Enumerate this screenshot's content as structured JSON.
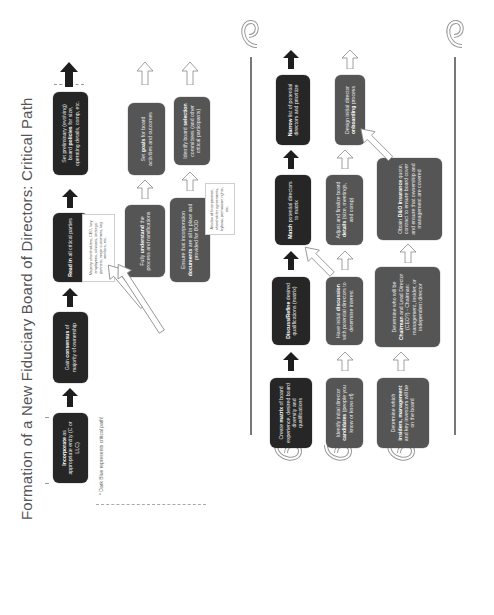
{
  "title": "Formation of a New Fiduciary Board of Directors: Critical Path",
  "legend": "* Dark Blue represents critical path!",
  "colors": {
    "critical": "#262626",
    "secondary": "#555555",
    "arrow_critical": "#1e1e1e",
    "arrow_secondary": "#ffffff",
    "line": "#777777"
  },
  "phase1": {
    "critical_path": [
      {
        "bold": "Incorporate",
        "text": " as appropriate entity (C or LLC)"
      },
      {
        "bold": "",
        "text": "Gain ",
        "bold2": "consensus",
        "text2": " of majority of ownership"
      },
      {
        "bold": "Read in",
        "text": " all critical parties"
      },
      {
        "bold": "",
        "text": "Set preliminary (evolving) board ",
        "bold2": "policies",
        "text2": " for size, operating details, comp, etc."
      }
    ],
    "read_in_note": "Majority shareholders, CEO, key employees, advisors, strategic partners, major customers, key vendors, etc.",
    "row2": [
      {
        "text": "Fully ",
        "bold": "understand",
        "text2": " the process and ramifications"
      },
      {
        "text": "Set ",
        "bold": "goals",
        "text2": " for board activities and outcomes"
      }
    ],
    "row3": [
      {
        "text": "Ensure that incorporation ",
        "bold": "documents",
        "text2": " are all in place and provided for BOD"
      },
      {
        "text": "Identify board ",
        "bold": "selection",
        "text2": " committees (and other critical participants)"
      }
    ],
    "ensure_note": "Articles of Incorporation, shareholder agreements, bylaws, permission rights, etc."
  },
  "phase2": {
    "row1": [
      {
        "text": "Create ",
        "bold": "matrix",
        "text2": " of board experience, desired board diversity and qualifications"
      },
      {
        "bold": "Discuss/Refine",
        "text2": " desired qualifications (matrix)"
      },
      {
        "bold": "Match",
        "text2": " potential directors to matrix"
      },
      {
        "bold": "Narrow",
        "text2": " list of potential directors and prioritize"
      }
    ],
    "row2": [
      {
        "text": "Identify initial director ",
        "bold": "candidates",
        "text2": " (people you know or know of)"
      },
      {
        "text": "Have initial ",
        "bold": "discussion",
        "text2": " with potential directors to determine interest"
      },
      {
        "text": "Adjust and finalize board ",
        "bold": "details",
        "text2": " (size, meetings, and comp)"
      },
      {
        "text": "Design initial director ",
        "bold": "onboarding",
        "text2": " process"
      }
    ],
    "row3": [
      {
        "text": "Determine which ",
        "bold": "insiders, management",
        "text2": " and key investors will be on the board"
      },
      {
        "text": "Determine who will be ",
        "bold": "Chairman",
        "text2": " and Lead Director (CEO?) - Chairman: management, insider, or independent director"
      },
      {
        "text": "Obtain ",
        "bold": "D&O insurance",
        "text2": " quote, contract to ensure board cover and ensure that ownership and management are covered"
      }
    ]
  }
}
